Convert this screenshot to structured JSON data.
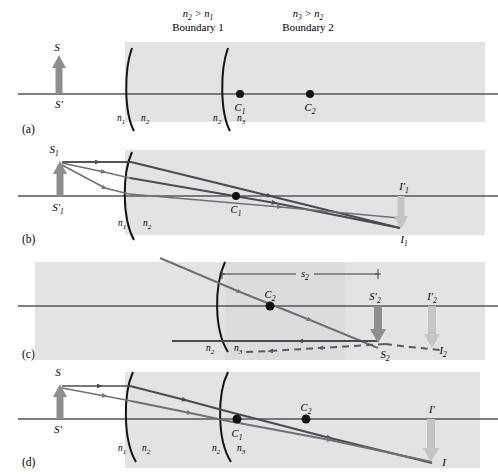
{
  "figure": {
    "background_color": "#ffffff",
    "medium_fill": "#e3e3e3",
    "ray_dark": "#4a4a52",
    "ray_mid": "#6f6f78",
    "object_arrow_dark": "#8e8e8e",
    "image_arrow_light": "#c4c4c4",
    "axis_color": "#55555c",
    "boundary_color": "#1a1a1a"
  },
  "panels": [
    {
      "id": "a",
      "caption": "(a)",
      "headers": [
        {
          "name": "boundary1-index-relation",
          "text": "n2 > n1",
          "base": "n",
          "sub_a": "2",
          "sub_b": "1"
        },
        {
          "name": "boundary1-title",
          "text": "Boundary 1"
        },
        {
          "name": "boundary2-index-relation",
          "text": "n3 > n2",
          "base": "n",
          "sub_a": "3",
          "sub_b": "2"
        },
        {
          "name": "boundary2-title",
          "text": "Boundary 2"
        }
      ],
      "object": {
        "label": "S",
        "label_axis": "S'"
      },
      "centers": [
        {
          "label": "C",
          "sub": "1"
        },
        {
          "label": "C",
          "sub": "2"
        }
      ],
      "media_labels": [
        {
          "label": "n",
          "sub": "1"
        },
        {
          "label": "n",
          "sub": "2"
        },
        {
          "label": "n",
          "sub": "2"
        },
        {
          "label": "n",
          "sub": "3"
        }
      ]
    },
    {
      "id": "b",
      "caption": "(b)",
      "object": {
        "label": "S",
        "sub": "1",
        "label_axis": "S'",
        "axis_sub": "1"
      },
      "centers": [
        {
          "label": "C",
          "sub": "1"
        }
      ],
      "images": [
        {
          "label": "I'",
          "sub": "1",
          "kind": "axis"
        },
        {
          "label": "I",
          "sub": "1",
          "kind": "tip"
        }
      ],
      "media_labels": [
        {
          "label": "n",
          "sub": "1"
        },
        {
          "label": "n",
          "sub": "2"
        }
      ]
    },
    {
      "id": "c",
      "caption": "(c)",
      "dimension": {
        "label": "s",
        "sub": "2"
      },
      "centers": [
        {
          "label": "C",
          "sub": "2"
        }
      ],
      "objects": [
        {
          "label": "S'",
          "sub": "2",
          "kind": "axis"
        },
        {
          "label": "S",
          "sub": "2",
          "kind": "tip-dashed"
        }
      ],
      "images": [
        {
          "label": "I'",
          "sub": "2",
          "kind": "axis"
        },
        {
          "label": "I",
          "sub": "2",
          "kind": "tip"
        }
      ],
      "media_labels": [
        {
          "label": "n",
          "sub": "2"
        },
        {
          "label": "n",
          "sub": "3"
        }
      ]
    },
    {
      "id": "d",
      "caption": "(d)",
      "object": {
        "label": "S",
        "label_axis": "S'"
      },
      "centers": [
        {
          "label": "C",
          "sub": "1"
        },
        {
          "label": "C",
          "sub": "2"
        }
      ],
      "images": [
        {
          "label": "I'",
          "kind": "axis"
        },
        {
          "label": "I",
          "kind": "tip"
        }
      ],
      "media_labels": [
        {
          "label": "n",
          "sub": "1"
        },
        {
          "label": "n",
          "sub": "2"
        },
        {
          "label": "n",
          "sub": "2"
        },
        {
          "label": "n",
          "sub": "3"
        }
      ]
    }
  ]
}
